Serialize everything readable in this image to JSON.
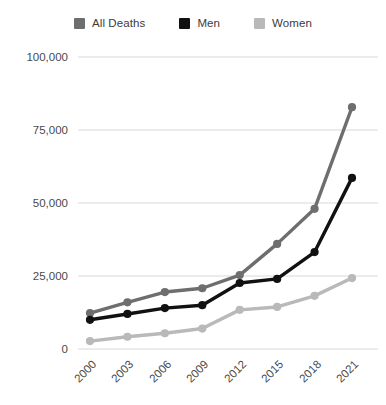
{
  "chart_data": {
    "type": "line",
    "title": "",
    "xlabel": "",
    "ylabel": "",
    "categories": [
      "2000",
      "2003",
      "2006",
      "2009",
      "2012",
      "2015",
      "2018",
      "2021"
    ],
    "series": [
      {
        "name": "All Deaths",
        "color": "#6e6e6e",
        "values": [
          12300,
          16000,
          19500,
          20800,
          25300,
          36000,
          48000,
          82800
        ]
      },
      {
        "name": "Men",
        "color": "#111111",
        "values": [
          10000,
          12000,
          14000,
          15000,
          22600,
          24000,
          33200,
          58600
        ]
      },
      {
        "name": "Women",
        "color": "#b9b9b9",
        "values": [
          2700,
          4200,
          5400,
          7000,
          13400,
          14400,
          18200,
          24300
        ]
      }
    ],
    "ylim": [
      0,
      100000
    ],
    "yticks": [
      0,
      25000,
      50000,
      75000,
      100000
    ],
    "ytick_labels": [
      "0",
      "25,000",
      "50,000",
      "75,000",
      "100,000"
    ],
    "grid": true,
    "legend_position": "top",
    "marker": "circle"
  },
  "legend": {
    "items": [
      {
        "label": "All Deaths",
        "color": "#6e6e6e"
      },
      {
        "label": "Men",
        "color": "#111111"
      },
      {
        "label": "Women",
        "color": "#b9b9b9"
      }
    ]
  },
  "axes": {
    "y_labels": [
      "100,000",
      "75,000",
      "50,000",
      "25,000",
      "0"
    ],
    "x_labels": [
      "2000",
      "2003",
      "2006",
      "2009",
      "2012",
      "2015",
      "2018",
      "2021"
    ]
  },
  "colors": {
    "all_deaths": "#6e6e6e",
    "men": "#111111",
    "women": "#b9b9b9",
    "gridline": "#d8d8d8",
    "tick_text": "#4a4a4a",
    "background": "#ffffff"
  }
}
